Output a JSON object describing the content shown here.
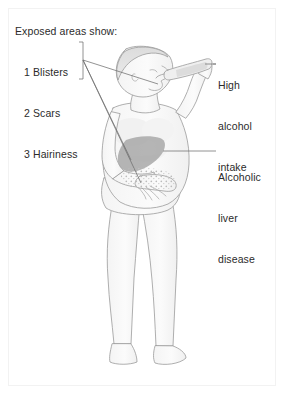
{
  "figure": {
    "background_color": "#ffffff",
    "line_color": "#9a9a9a",
    "text_color": "#2b2b2b",
    "organ_shade_color": "#a8a8a8",
    "skin_shade_color": "#ededed",
    "frame_color": "#f2f2f2"
  },
  "legend": {
    "title": "Exposed areas show:",
    "items": [
      {
        "number": "1",
        "label": "Blisters",
        "text": "1 Blisters"
      },
      {
        "number": "2",
        "label": "Scars",
        "text": "2 Scars"
      },
      {
        "number": "3",
        "label": "Hairiness",
        "text": "3 Hairiness"
      }
    ],
    "bracket": "vertical-bracket",
    "leader_count": 3
  },
  "callouts": [
    {
      "id": "alcohol-intake",
      "lines": [
        "High",
        "alcohol",
        "intake"
      ],
      "text": "High alcohol intake",
      "leader": "horizontal-line-to-bottle"
    },
    {
      "id": "liver-disease",
      "lines": [
        "Alcoholic",
        "liver",
        "disease"
      ],
      "text": "Alcoholic liver disease",
      "leader": "horizontal-line-to-liver"
    }
  ],
  "anatomy": {
    "parts": [
      "head",
      "face",
      "hair",
      "neck",
      "torso",
      "chest",
      "abdomen",
      "raised-arm",
      "bottle",
      "lower-arm",
      "hand",
      "hip",
      "buttock",
      "left-leg",
      "right-leg",
      "left-foot",
      "right-foot",
      "liver"
    ]
  }
}
